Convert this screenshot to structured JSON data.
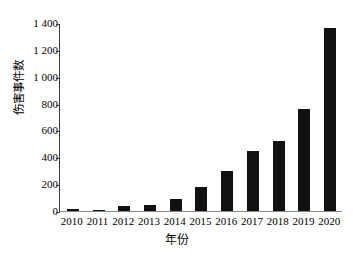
{
  "chart_data": {
    "type": "bar",
    "title": "",
    "xlabel": "年份",
    "ylabel": "伤害事件数",
    "categories": [
      "2010",
      "2011",
      "2012",
      "2013",
      "2014",
      "2015",
      "2016",
      "2017",
      "2018",
      "2019",
      "2020"
    ],
    "values": [
      15,
      10,
      40,
      48,
      90,
      180,
      295,
      450,
      525,
      760,
      1360
    ],
    "series": [
      {
        "name": "伤害事件数",
        "values": [
          15,
          10,
          40,
          48,
          90,
          180,
          295,
          450,
          525,
          760,
          1360
        ]
      }
    ],
    "ylim": [
      0,
      1400
    ],
    "yticks": [
      0,
      200,
      400,
      600,
      800,
      1000,
      1200,
      1400
    ],
    "ytick_labels": [
      "0",
      "200",
      "400",
      "600",
      "800",
      "1 000",
      "1 200",
      "1 400"
    ],
    "grid": false,
    "legend": false,
    "legend_position": "none",
    "bar_color": "#111111",
    "axis_color": "#3a3a3a",
    "background_color": "#ffffff"
  }
}
